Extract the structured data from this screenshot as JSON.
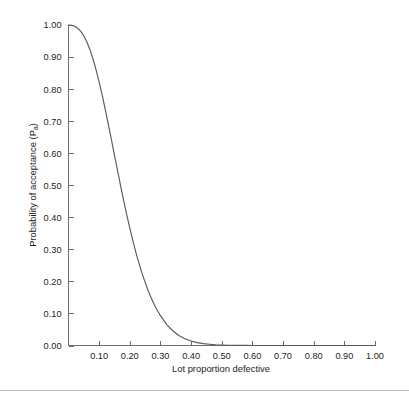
{
  "chart_data": {
    "type": "line",
    "title": "",
    "subtitle": "",
    "xlabel": "Lot proportion defective",
    "ylabel_main": "Probability of acceptance (P",
    "ylabel_sub": "a",
    "ylabel_close": ")",
    "ylabel_full": "Probability of acceptance (Pa)",
    "grid": false,
    "legend": "none",
    "xlim": [
      0.0,
      1.0
    ],
    "ylim": [
      0.0,
      1.0
    ],
    "xticks": [
      0.1,
      0.2,
      0.3,
      0.4,
      0.5,
      0.6,
      0.7,
      0.8,
      0.9,
      1.0
    ],
    "xtick_labels": [
      "0.10",
      "0.20",
      "0.30",
      "0.40",
      "0.50",
      "0.60",
      "0.70",
      "0.80",
      "0.90",
      "1.00"
    ],
    "yticks": [
      0.0,
      0.1,
      0.2,
      0.3,
      0.4,
      0.5,
      0.6,
      0.7,
      0.8,
      0.9,
      1.0
    ],
    "ytick_labels": [
      "0.00",
      "0.10",
      "0.20",
      "0.30",
      "0.40",
      "0.50",
      "0.60",
      "0.70",
      "0.80",
      "0.90",
      "1.00"
    ],
    "series": [
      {
        "name": "Operating characteristic curve",
        "color": "#595959",
        "x": [
          0.0,
          0.01,
          0.02,
          0.03,
          0.04,
          0.05,
          0.06,
          0.07,
          0.08,
          0.09,
          0.1,
          0.11,
          0.12,
          0.13,
          0.14,
          0.15,
          0.16,
          0.17,
          0.18,
          0.19,
          0.2,
          0.21,
          0.22,
          0.23,
          0.24,
          0.25,
          0.26,
          0.27,
          0.28,
          0.29,
          0.3,
          0.32,
          0.34,
          0.36,
          0.38,
          0.4,
          0.42,
          0.44,
          0.46,
          0.48,
          0.5,
          0.52,
          0.54,
          0.56,
          0.58,
          0.6,
          0.65,
          0.7,
          0.75,
          0.8,
          0.85,
          0.9,
          0.95,
          1.0
        ],
        "y": [
          1.0,
          0.999,
          0.996,
          0.99,
          0.98,
          0.966,
          0.947,
          0.923,
          0.894,
          0.86,
          0.822,
          0.781,
          0.736,
          0.69,
          0.642,
          0.594,
          0.546,
          0.498,
          0.452,
          0.408,
          0.366,
          0.327,
          0.29,
          0.256,
          0.225,
          0.197,
          0.171,
          0.148,
          0.127,
          0.109,
          0.093,
          0.066,
          0.046,
          0.031,
          0.021,
          0.014,
          0.009,
          0.006,
          0.004,
          0.002,
          0.0015,
          0.0009,
          0.0005,
          0.0003,
          0.0002,
          0.0001,
          3e-05,
          1e-05,
          4e-06,
          1e-06,
          4e-07,
          1e-07,
          3e-08,
          8e-09
        ]
      }
    ],
    "axis_color": "#6e6e6e",
    "background_color": "#ffffff",
    "tick_direction": "in"
  }
}
